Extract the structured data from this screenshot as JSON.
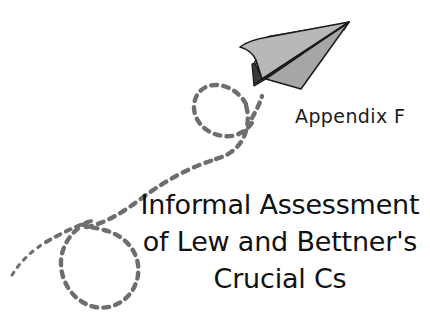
{
  "page": {
    "background_color": "#ffffff",
    "width": 430,
    "height": 321
  },
  "appendix": {
    "label": "Appendix F",
    "color": "#1b1b1b"
  },
  "title": {
    "lines": [
      "Informal Assessment",
      "of Lew and Bettner's",
      "Crucial Cs"
    ],
    "full_text": "Informal Assessment of Lew and Bettner's Crucial Cs",
    "color": "#111111",
    "align": "center"
  },
  "illustration": {
    "paper_airplane": {
      "name": "paper-airplane",
      "outline_color": "#1a1a1a",
      "light_gray": "#b6b6b6",
      "mid_gray": "#9a9a9a",
      "shadow_gray": "#3a3a3a",
      "hatch_color": "#2b2b2b"
    },
    "flight_trail": {
      "name": "dashed-flight-trail",
      "color": "#6e6e6e",
      "style": "dashed",
      "loops": 2
    }
  }
}
